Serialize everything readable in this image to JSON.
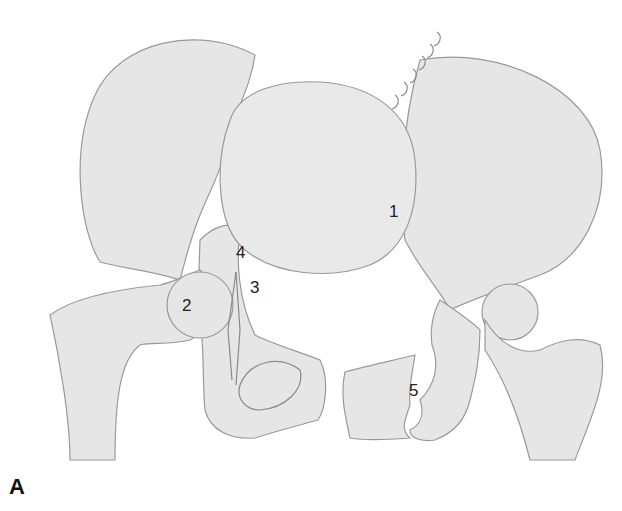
{
  "figure": {
    "panel_label": "A",
    "labels": [
      {
        "id": "1",
        "text": "1"
      },
      {
        "id": "2",
        "text": "2"
      },
      {
        "id": "3",
        "text": "3"
      },
      {
        "id": "4",
        "text": "4"
      },
      {
        "id": "5",
        "text": "5"
      }
    ],
    "colors": {
      "bone_fill": "#e6e6e6",
      "outline": "#9a9a9a",
      "background": "#ffffff"
    }
  }
}
